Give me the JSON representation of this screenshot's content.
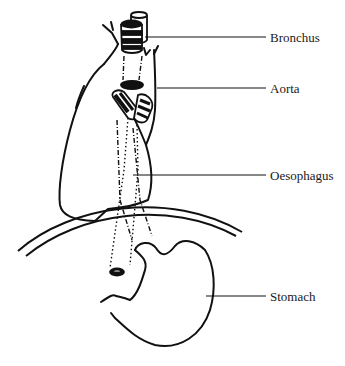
{
  "diagram": {
    "type": "anatomical line drawing",
    "labels": [
      {
        "id": "bronchus",
        "text": "Bronchus",
        "x": 270,
        "y": 31
      },
      {
        "id": "aorta",
        "text": "Aorta",
        "x": 270,
        "y": 82
      },
      {
        "id": "oesophagus",
        "text": "Oesophagus",
        "x": 270,
        "y": 169
      },
      {
        "id": "stomach",
        "text": "Stomach",
        "x": 270,
        "y": 290
      }
    ],
    "leader_lines": [
      {
        "id": "bronchus",
        "x1": 145,
        "y1": 37,
        "x2": 266,
        "y2": 37
      },
      {
        "id": "aorta",
        "x1": 157,
        "y1": 88,
        "x2": 266,
        "y2": 88
      },
      {
        "id": "oesophagus",
        "x1": 133,
        "y1": 175,
        "x2": 266,
        "y2": 175
      },
      {
        "id": "stomach",
        "x1": 206,
        "y1": 296,
        "x2": 266,
        "y2": 296
      }
    ],
    "colors": {
      "ink": "#111111",
      "background": "#ffffff",
      "label": "#1a1a1a"
    }
  }
}
